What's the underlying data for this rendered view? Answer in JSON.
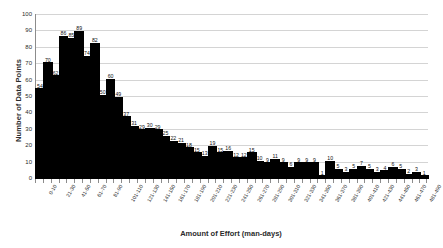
{
  "chart_data": {
    "type": "bar",
    "title": "",
    "xlabel": "Amount of Effort (man-days)",
    "ylabel": "Number of Data Points",
    "ylim": [
      0,
      100
    ],
    "yticks": [
      0,
      10,
      20,
      30,
      40,
      50,
      60,
      70,
      80,
      90,
      100
    ],
    "grid": true,
    "legend": "none",
    "label_every_nth": 2,
    "categories": [
      "0-10",
      "11-20",
      "21-30",
      "31-40",
      "41-50",
      "51-60",
      "61-70",
      "71-80",
      "81-90",
      "91-100",
      "101-110",
      "111-120",
      "121-130",
      "131-140",
      "141-150",
      "151-160",
      "161-170",
      "171-180",
      "181-190",
      "191-200",
      "201-210",
      "211-220",
      "221-230",
      "231-240",
      "241-250",
      "251-260",
      "261-270",
      "271-280",
      "281-290",
      "291-300",
      "301-310",
      "311-320",
      "321-330",
      "331-340",
      "341-350",
      "351-360",
      "361-370",
      "371-380",
      "381-390",
      "391-400",
      "401-410",
      "411-420",
      "421-430",
      "431-440",
      "441-450",
      "451-460",
      "461-470",
      "471-480",
      "481-490",
      "491-500"
    ],
    "values": [
      54,
      70,
      62,
      86,
      85,
      89,
      74,
      82,
      50,
      60,
      49,
      37,
      31,
      29,
      30,
      29,
      25,
      22,
      21,
      18,
      15,
      13,
      19,
      15,
      16,
      12,
      12,
      15,
      10,
      9,
      11,
      9,
      6,
      9,
      9,
      9,
      1,
      10,
      5,
      3,
      5,
      7,
      5,
      3,
      4,
      6,
      5,
      2,
      3,
      1
    ]
  }
}
